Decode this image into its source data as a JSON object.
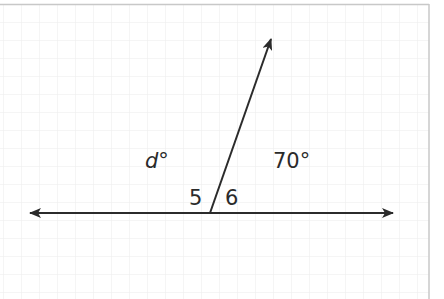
{
  "figure": {
    "line": {
      "from": [
        30,
        213
      ],
      "to": [
        393,
        213
      ],
      "arrows": "both"
    },
    "ray": {
      "from": [
        210,
        213
      ],
      "to": [
        271,
        39
      ],
      "arrow": "end"
    },
    "labels": {
      "left_angle": {
        "var": "d",
        "degree": "°"
      },
      "right_angle": "70°",
      "angle_5": "5",
      "angle_6": "6"
    },
    "colors": {
      "ink": "#2b2b2b",
      "grid": "#ebebeb",
      "border": "#c8c8c8",
      "background": "#ffffff"
    },
    "grid_spacing_px": 18
  }
}
